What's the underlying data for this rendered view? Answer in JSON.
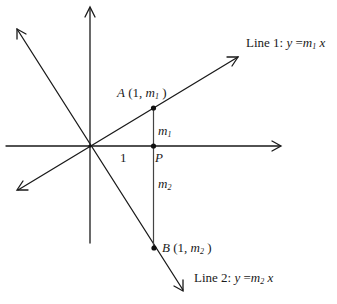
{
  "figure": {
    "type": "coordinate-geometry-diagram",
    "colors": {
      "background": "#ffffff",
      "ink": "#1a1a1a",
      "segment": "#444444"
    }
  },
  "lines": [
    {
      "id": "line1",
      "label_prefix": "Line 1: ",
      "var_y": "y",
      "eq": " =",
      "coef": "m",
      "coef_sub": "1",
      "var_x": " x"
    },
    {
      "id": "line2",
      "label_prefix": "Line 2: ",
      "var_y": "y",
      "eq": " =",
      "coef": "m",
      "coef_sub": "2",
      "var_x": " x"
    }
  ],
  "points": {
    "A": {
      "name": "A",
      "coords_open": " (1, ",
      "coord_var": "m",
      "coord_sub": "1",
      "coords_close": " )"
    },
    "B": {
      "name": "B",
      "coords_open": " (1, ",
      "coord_var": "m",
      "coord_sub": "2",
      "coords_close": " )"
    },
    "P": {
      "name": "P"
    }
  },
  "segment_labels": {
    "upper": {
      "var": "m",
      "sub": "1"
    },
    "lower": {
      "var": "m",
      "sub": "2"
    }
  },
  "axis_labels": {
    "unit_tick": "1"
  }
}
